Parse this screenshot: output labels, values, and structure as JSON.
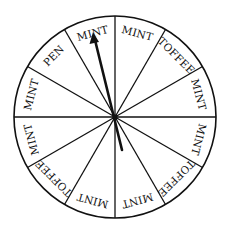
{
  "wheel": {
    "segment_count": 12,
    "segments": [
      {
        "label": "MINT"
      },
      {
        "label": "TOFFEE"
      },
      {
        "label": "MINT"
      },
      {
        "label": "MINT"
      },
      {
        "label": "TOFFEE"
      },
      {
        "label": "MINT"
      },
      {
        "label": "MINT"
      },
      {
        "label": "TOFFEE"
      },
      {
        "label": "MINT"
      },
      {
        "label": "MINT"
      },
      {
        "label": "PEN"
      },
      {
        "label": "MINT"
      }
    ],
    "pointer": {
      "icon": "arrow-icon",
      "pointing_at": "MINT"
    }
  },
  "colors": {
    "line": "#111111",
    "background": "#ffffff"
  }
}
